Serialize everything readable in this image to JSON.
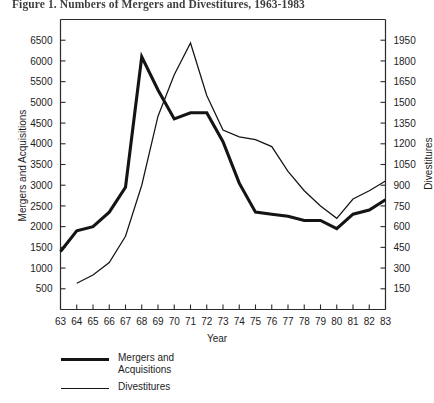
{
  "figure": {
    "title": "Figure 1. Numbers of Mergers and Divestitures, 1963-1983"
  },
  "axes": {
    "x_title": "Year",
    "y_left_title": "Mergers and Acquisitions",
    "y_right_title": "Divestitures"
  },
  "legend": {
    "items": [
      {
        "label": "Mergers and\nAcquisitions",
        "style": "thick",
        "color": "#141414"
      },
      {
        "label": "Divestitures",
        "style": "thin",
        "color": "#141414"
      }
    ]
  },
  "chart_data": {
    "type": "line",
    "title": "Figure 1. Numbers of Mergers and Divestitures, 1963-1983",
    "xlabel": "Year",
    "ylabel": "Mergers and Acquisitions",
    "y2label": "Divestitures",
    "grid": false,
    "legend_position": "below-left",
    "categories": [
      "63",
      "64",
      "65",
      "66",
      "67",
      "68",
      "69",
      "70",
      "71",
      "72",
      "73",
      "74",
      "75",
      "76",
      "77",
      "78",
      "79",
      "80",
      "81",
      "82",
      "83"
    ],
    "x": [
      1963,
      1964,
      1965,
      1966,
      1967,
      1968,
      1969,
      1970,
      1971,
      1972,
      1973,
      1974,
      1975,
      1976,
      1977,
      1978,
      1979,
      1980,
      1981,
      1982,
      1983
    ],
    "xlim": [
      1963,
      1983
    ],
    "ylim": [
      0,
      7000
    ],
    "y2lim": [
      0,
      2100
    ],
    "y_ticks": [
      500,
      1000,
      1500,
      2000,
      2500,
      3000,
      3500,
      4000,
      4500,
      5000,
      5500,
      6000,
      6500
    ],
    "y2_ticks": [
      150,
      300,
      450,
      600,
      750,
      900,
      1050,
      1200,
      1350,
      1500,
      1650,
      1800,
      1950
    ],
    "series": [
      {
        "name": "Mergers and Acquisitions",
        "axis": "left",
        "style": "thick",
        "color": "#141414",
        "values": [
          1400,
          1900,
          2000,
          2350,
          2950,
          6100,
          5300,
          4600,
          4750,
          4750,
          4050,
          3050,
          2350,
          2300,
          2250,
          2150,
          2150,
          1950,
          2300,
          2400,
          2650
        ]
      },
      {
        "name": "Divestitures",
        "axis": "right",
        "style": "thin",
        "color": "#141414",
        "values": [
          null,
          190,
          250,
          340,
          530,
          900,
          1400,
          1700,
          1930,
          1550,
          1300,
          1250,
          1230,
          1180,
          1000,
          860,
          750,
          660,
          800,
          860,
          930
        ]
      }
    ]
  }
}
